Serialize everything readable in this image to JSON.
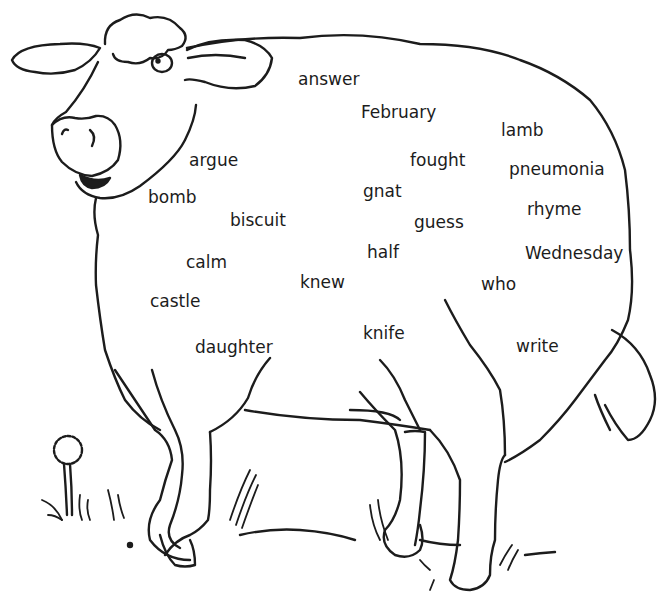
{
  "worksheet": {
    "illustration": "sheep-outline",
    "ink_color": "#1c1c1c",
    "background_color": "#ffffff",
    "words": [
      {
        "text": "answer",
        "x": 298,
        "y": 71
      },
      {
        "text": "February",
        "x": 361,
        "y": 104
      },
      {
        "text": "lamb",
        "x": 501,
        "y": 122
      },
      {
        "text": "argue",
        "x": 189,
        "y": 152
      },
      {
        "text": "fought",
        "x": 410,
        "y": 152
      },
      {
        "text": "pneumonia",
        "x": 509,
        "y": 161
      },
      {
        "text": "bomb",
        "x": 148,
        "y": 189
      },
      {
        "text": "gnat",
        "x": 363,
        "y": 183
      },
      {
        "text": "rhyme",
        "x": 527,
        "y": 201
      },
      {
        "text": "biscuit",
        "x": 230,
        "y": 212
      },
      {
        "text": "guess",
        "x": 414,
        "y": 214
      },
      {
        "text": "half",
        "x": 367,
        "y": 244
      },
      {
        "text": "Wednesday",
        "x": 525,
        "y": 245
      },
      {
        "text": "calm",
        "x": 186,
        "y": 254
      },
      {
        "text": "knew",
        "x": 300,
        "y": 274
      },
      {
        "text": "who",
        "x": 481,
        "y": 276
      },
      {
        "text": "castle",
        "x": 150,
        "y": 293
      },
      {
        "text": "knife",
        "x": 363,
        "y": 325
      },
      {
        "text": "daughter",
        "x": 195,
        "y": 339
      },
      {
        "text": "write",
        "x": 516,
        "y": 338
      }
    ]
  }
}
